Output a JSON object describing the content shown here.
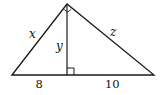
{
  "diagram": {
    "type": "right triangle with altitude to hypotenuse",
    "stroke_color": "#1a1a1a",
    "background": "#ffffff",
    "vertices": {
      "apex": [
        67,
        4
      ],
      "left": [
        12,
        75
      ],
      "right": [
        154,
        75
      ],
      "foot": [
        67,
        75
      ]
    },
    "labels": {
      "left_leg": "x",
      "altitude": "y",
      "right_leg": "z",
      "left_segment": "8",
      "right_segment": "10"
    },
    "markers": {
      "apex_right_angle": true,
      "foot_right_angle": true
    }
  }
}
